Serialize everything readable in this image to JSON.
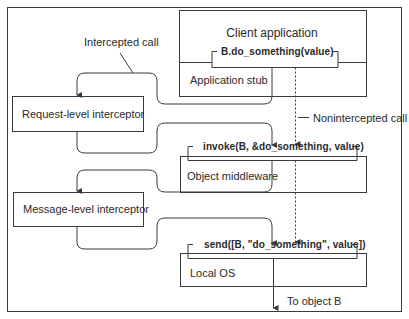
{
  "diagram": {
    "boxes": {
      "client_application": "Client application",
      "application_stub": "Application stub",
      "object_middleware": "Object middleware",
      "local_os": "Local OS",
      "request_interceptor": "Request-level interceptor",
      "message_interceptor": "Message-level interceptor"
    },
    "calls": {
      "app_call": "B.do_something(value)",
      "middleware_call": "invoke(B, &do_something, value)",
      "os_call": "send([B, \"do_something\", value])"
    },
    "annotations": {
      "intercepted": "Intercepted call",
      "nonintercepted": "Nonintercepted call",
      "destination": "To object B"
    },
    "colors": {
      "line": "#3a3a3a",
      "background": "#ffffff"
    }
  }
}
